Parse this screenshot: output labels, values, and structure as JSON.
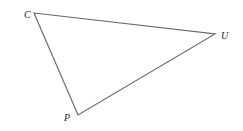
{
  "diagram": {
    "type": "triangle",
    "stroke_color": "#6b6b6b",
    "label_color": "#222222",
    "vertices": [
      {
        "name": "C",
        "x": 34,
        "y": 13,
        "label_x": 24,
        "label_y": 18
      },
      {
        "name": "U",
        "x": 215,
        "y": 34,
        "label_x": 221,
        "label_y": 39
      },
      {
        "name": "P",
        "x": 78,
        "y": 115,
        "label_x": 64,
        "label_y": 121
      }
    ],
    "edges": [
      [
        "C",
        "U"
      ],
      [
        "U",
        "P"
      ],
      [
        "P",
        "C"
      ]
    ]
  }
}
